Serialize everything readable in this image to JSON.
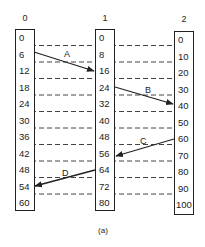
{
  "columns": [
    {
      "title": "0",
      "values": [
        "0",
        "6",
        "12",
        "18",
        "24",
        "30",
        "36",
        "42",
        "48",
        "54",
        "60"
      ]
    },
    {
      "title": "1",
      "values": [
        "0",
        "8",
        "16",
        "24",
        "32",
        "40",
        "48",
        "56",
        "64",
        "72",
        "80"
      ]
    },
    {
      "title": "2",
      "values": [
        "0",
        "10",
        "20",
        "30",
        "40",
        "50",
        "60",
        "70",
        "80",
        "90",
        "100"
      ]
    }
  ],
  "arrows": [
    {
      "label": "A",
      "from": "col0:6",
      "to": "col1:16"
    },
    {
      "label": "B",
      "from": "col1:24",
      "to": "col2:40"
    },
    {
      "label": "C",
      "from": "col2:60",
      "to": "col1:56"
    },
    {
      "label": "D",
      "from": "col1:64",
      "to": "col0:54"
    }
  ],
  "caption": "(a)"
}
